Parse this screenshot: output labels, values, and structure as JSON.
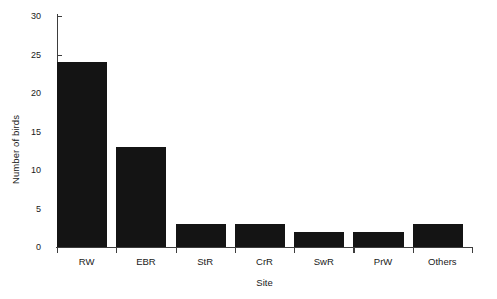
{
  "chart_data": {
    "type": "bar",
    "title": "",
    "subtitle": "",
    "xlabel": "Site",
    "ylabel": "Number of birds",
    "categories": [
      "RW",
      "EBR",
      "StR",
      "CrR",
      "SwR",
      "PrW",
      "Others"
    ],
    "values": [
      24,
      13,
      3,
      3,
      2,
      2,
      3
    ],
    "series": [
      {
        "name": "Number of birds",
        "values": [
          24,
          13,
          3,
          3,
          2,
          2,
          3
        ]
      }
    ],
    "ylim": [
      0,
      30
    ],
    "yticks": [
      0,
      5,
      10,
      15,
      20,
      25,
      30
    ],
    "ytick_labels": [
      "0",
      "5",
      "10",
      "15",
      "20",
      "25",
      "30"
    ],
    "grid": false,
    "legend": false,
    "legend_position": "none",
    "bar_color": "#141414",
    "axis_color": "#3d3d3d",
    "background_color": "#ffffff",
    "annotations": []
  }
}
